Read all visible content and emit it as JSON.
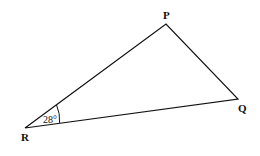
{
  "diagram": {
    "type": "triangle",
    "vertices": {
      "P": {
        "label": "P"
      },
      "Q": {
        "label": "Q"
      },
      "R": {
        "label": "R"
      }
    },
    "angle_R": {
      "label": "28°",
      "value_degrees": 28
    }
  }
}
